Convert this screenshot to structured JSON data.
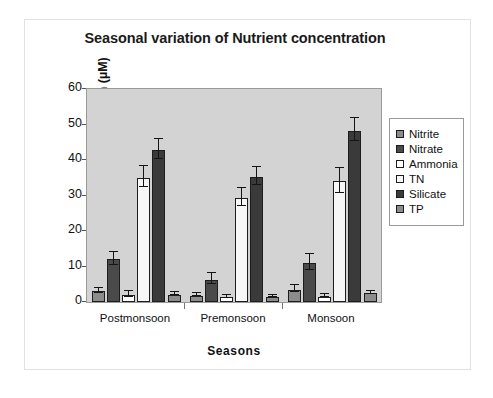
{
  "chart_data": {
    "type": "bar",
    "title": "Seasonal variation of Nutrient concentration",
    "xlabel": "Seasons",
    "ylabel": "Nutrient concentration (µM)",
    "categories": [
      "Postmonsoon",
      "Premonsoon",
      "Monsoon"
    ],
    "ylim": [
      0,
      60
    ],
    "yticks": [
      0,
      10,
      20,
      30,
      40,
      50,
      60
    ],
    "grid": false,
    "legend_position": "right",
    "error_bars": true,
    "series": [
      {
        "name": "Nitrite",
        "color": "#8c8c8c",
        "values": [
          3.0,
          1.8,
          3.5
        ],
        "errors": [
          0.8,
          0.5,
          1.0
        ]
      },
      {
        "name": "Nitrate",
        "color": "#4a4a4a",
        "values": [
          12.0,
          6.3,
          11.0
        ],
        "errors": [
          1.8,
          1.6,
          2.2
        ]
      },
      {
        "name": "Ammonia",
        "color": "#ffffff",
        "values": [
          2.0,
          1.3,
          1.5
        ],
        "errors": [
          0.8,
          0.4,
          0.4
        ]
      },
      {
        "name": "TN",
        "color": "#f7f7f7",
        "values": [
          35.0,
          29.2,
          34.0
        ],
        "errors": [
          3.0,
          2.5,
          3.5
        ]
      },
      {
        "name": "Silicate",
        "color": "#3a3a3a",
        "values": [
          42.8,
          35.2,
          48.3
        ],
        "errors": [
          2.8,
          2.5,
          3.2
        ]
      },
      {
        "name": "TP",
        "color": "#8c8c8c",
        "values": [
          2.1,
          1.4,
          2.5
        ],
        "errors": [
          0.4,
          0.3,
          0.4
        ]
      }
    ]
  }
}
